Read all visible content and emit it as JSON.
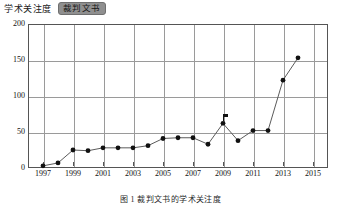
{
  "header": {
    "attention_label": "学术关注度",
    "series_chip_label": "裁判文书"
  },
  "caption": "图 1  裁判文书的学术关注度",
  "colors": {
    "line": "#5b5b5b",
    "dot": "#111111",
    "grid": "#9a9a9a",
    "frame": "#555555",
    "chip_background": "#8f8f8f"
  },
  "chart_data": {
    "type": "line",
    "title": "学术关注度",
    "subtitle": "裁判文书",
    "xlabel": "",
    "ylabel": "",
    "x": [
      1997,
      1998,
      1999,
      2000,
      2001,
      2002,
      2003,
      2004,
      2005,
      2006,
      2007,
      2008,
      2009,
      2010,
      2011,
      2012,
      2013,
      2014
    ],
    "values": [
      3,
      7,
      25,
      24,
      28,
      28,
      28,
      31,
      41,
      42,
      42,
      33,
      62,
      38,
      52,
      52,
      122,
      153
    ],
    "series": [
      {
        "name": "裁判文书",
        "values": [
          3,
          7,
          25,
          24,
          28,
          28,
          28,
          31,
          41,
          42,
          42,
          33,
          62,
          38,
          52,
          52,
          122,
          153
        ]
      }
    ],
    "xlim": [
      1996,
      2016
    ],
    "ylim": [
      0,
      200
    ],
    "yticks": [
      0,
      50,
      100,
      150,
      200
    ],
    "ytick_labels": [
      "0",
      "50",
      "100",
      "150",
      "200"
    ],
    "xticks": [
      1997,
      1999,
      2001,
      2003,
      2005,
      2007,
      2009,
      2011,
      2013,
      2015
    ],
    "xtick_labels": [
      "1997",
      "1999",
      "2001",
      "2003",
      "2005",
      "2007",
      "2009",
      "2011",
      "2013",
      "2015"
    ],
    "grid": true,
    "legend_position": "top-left",
    "markers": "circle",
    "annotations": [
      {
        "x": 2009,
        "y": 62,
        "type": "flag-marker",
        "label": ""
      }
    ]
  }
}
